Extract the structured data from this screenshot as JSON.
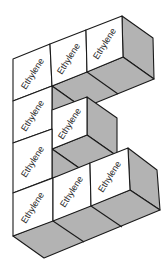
{
  "figure": {
    "colors": {
      "front_face": "#ffffff",
      "shaded_face": "#b3b3b3",
      "edge": "#1a1a1a",
      "text": "#2a2a2a"
    },
    "cubes": [
      {
        "id": "r0c0",
        "label": "Ethylene"
      },
      {
        "id": "r0c1",
        "label": "Ethylene"
      },
      {
        "id": "r0c2",
        "label": "Ethylene"
      },
      {
        "id": "r1c0",
        "label": "Ethylene"
      },
      {
        "id": "r1c1",
        "label": "Ethylene"
      },
      {
        "id": "r2c0",
        "label": "Ethylene"
      },
      {
        "id": "r3c0",
        "label": "Ethylene"
      },
      {
        "id": "r3c1",
        "label": "Ethylene"
      },
      {
        "id": "r3c2",
        "label": "Ethylene"
      }
    ]
  }
}
